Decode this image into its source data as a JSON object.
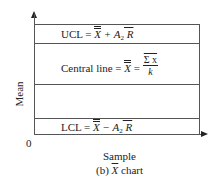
{
  "figure": {
    "y_axis_label": "Mean",
    "x_axis_label": "Sample",
    "origin_label": "0",
    "caption_prefix": "(b) ",
    "caption_symbol": "X",
    "caption_suffix": " chart"
  },
  "lines": {
    "ucl": {
      "label": "UCL = ",
      "x": "X",
      "plus": " + A",
      "sub": "2",
      "r": " R"
    },
    "central": {
      "label": "Central line = ",
      "x": "X",
      "eq": " = ",
      "num": "Σ x",
      "den": "k"
    },
    "lcl": {
      "label": "LCL = ",
      "x": "X",
      "minus": " − A",
      "sub": "2",
      "r": " R"
    }
  }
}
